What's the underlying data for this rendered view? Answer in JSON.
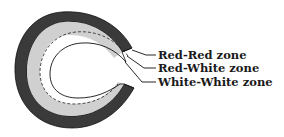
{
  "diagram": {
    "type": "cross-section zone diagram",
    "colors": {
      "red_red": "#3a3a3a",
      "red_white": "#d0d0d0",
      "white_white": "#ffffff",
      "outline": "#111111"
    },
    "labels": [
      {
        "id": "red-red",
        "text": "Red-Red zone"
      },
      {
        "id": "red-white",
        "text": "Red-White zone"
      },
      {
        "id": "white-white",
        "text": "White-White zone"
      }
    ]
  }
}
